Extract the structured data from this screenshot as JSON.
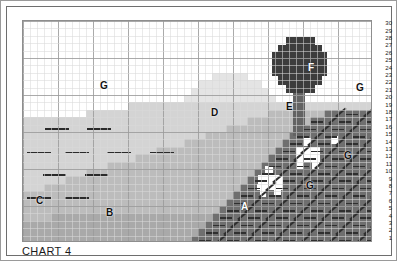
{
  "caption": "CHART 4",
  "chart_data": {
    "type": "heatmap",
    "title": "CHART 4",
    "xlabel": "",
    "ylabel": "",
    "grid": true,
    "legend_position": "none",
    "columns": 50,
    "rows": 30,
    "row_labels": [
      "30",
      "29",
      "28",
      "27",
      "26",
      "25",
      "24",
      "23",
      "22",
      "21",
      "20",
      "19",
      "18",
      "17",
      "16",
      "15",
      "14",
      "13",
      "12",
      "11",
      "10",
      "9",
      "8",
      "7",
      "6",
      "5",
      "4",
      "3",
      "2",
      "1"
    ],
    "region_labels": [
      {
        "id": "A",
        "label": "A",
        "x": 233,
        "y": 199,
        "color": "#6e6e6e",
        "description": "dark hatched foreground hillside",
        "light_text": true
      },
      {
        "id": "B",
        "label": "B",
        "x": 98,
        "y": 205,
        "color": "#b9b9b9",
        "description": "mid-grey lower meadow"
      },
      {
        "id": "C",
        "label": "C",
        "x": 28,
        "y": 193,
        "color": "#d2d2d2",
        "description": "light grey left field"
      },
      {
        "id": "D",
        "label": "D",
        "x": 203,
        "y": 105,
        "color": "#e2e2e2",
        "description": "pale distant hill"
      },
      {
        "id": "E",
        "label": "E",
        "x": 278,
        "y": 99,
        "color": "#636363",
        "description": "tree trunk"
      },
      {
        "id": "F",
        "label": "F",
        "x": 300,
        "y": 60,
        "color": "#3a3a3a",
        "description": "tree canopy",
        "light_text": true
      },
      {
        "id": "G",
        "label": "G",
        "x": 92,
        "y": 78,
        "color": "#ffffff",
        "description": "sky / white background"
      },
      {
        "id": "G",
        "label": "G",
        "x": 348,
        "y": 80,
        "color": "#ffffff",
        "description": "sky / white background right"
      },
      {
        "id": "G",
        "label": "G",
        "x": 298,
        "y": 178,
        "color": "#ffffff",
        "description": "white sheep lower"
      },
      {
        "id": "G",
        "label": "G",
        "x": 336,
        "y": 148,
        "color": "#ffffff",
        "description": "white sheep upper"
      }
    ],
    "palette": {
      "sky": "#ffffff",
      "pale_hill": "#e4e4e4",
      "light_field": "#d4d4d4",
      "mid_field": "#bcbcbc",
      "dark_field": "#a9a9a9",
      "foreground": "#6f6f6f",
      "tree_canopy": "#3c3c3c",
      "tree_trunk": "#636363",
      "grid_minor": "#d8d8d8",
      "grid_major": "#9b9b9b",
      "stitch_dark": "#2a2a2a",
      "page": "#ffffff",
      "frame": "#6e6e6e"
    },
    "symbols": {
      "dash": "horizontal dash stitch",
      "slash": "diagonal slash stitch",
      "blank": "empty cell"
    }
  }
}
